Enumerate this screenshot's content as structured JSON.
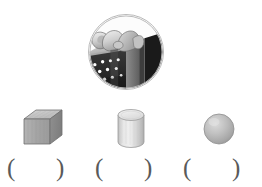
{
  "worksheet": {
    "title": "Shape identification worksheet",
    "background_color": "#ffffff"
  },
  "photo": {
    "name": "gift-box-photo",
    "description": "Circular photograph of a polka-dot gift box with a ribbon bow",
    "frame_shape": "circle",
    "frame_color": "#b9b9b9",
    "subject": "gift box with bow",
    "colors": {
      "box_dark": "#2b2b2b",
      "box_mid": "#7d7d7d",
      "box_light": "#c9c9c9",
      "bow_light": "#e2e2e2",
      "dot": "#ffffff"
    }
  },
  "shapes": [
    {
      "name": "cube",
      "label": "cube",
      "colors": {
        "top": "#c6c6c6",
        "front": "#a8a8a8",
        "side": "#8b8b8b",
        "outline": "#6f6f6f"
      }
    },
    {
      "name": "cylinder",
      "label": "cylinder",
      "colors": {
        "top": "#e8e8e8",
        "body": "#d2d2d2",
        "shade": "#b4b4b4",
        "outline": "#9a9a9a"
      }
    },
    {
      "name": "sphere",
      "label": "sphere",
      "colors": {
        "highlight": "#d8d8d8",
        "mid": "#b6b6b6",
        "shade": "#9a9a9a",
        "outline": "#8f8f8f"
      }
    }
  ],
  "answers": [
    {
      "name": "answer-blank-cube",
      "left": "(",
      "right": ")",
      "value": ""
    },
    {
      "name": "answer-blank-cylinder",
      "left": "(",
      "right": ")",
      "value": ""
    },
    {
      "name": "answer-blank-sphere",
      "left": "(",
      "right": ")",
      "value": ""
    }
  ]
}
